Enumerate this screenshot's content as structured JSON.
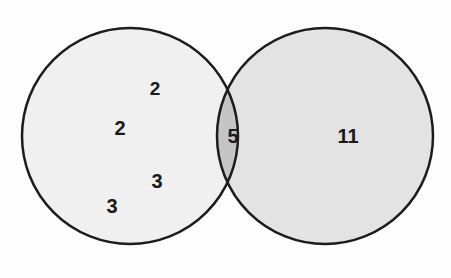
{
  "diagram": {
    "type": "venn-2-set",
    "background_color": "#fdfdfd",
    "stroke_color": "#1c1c1c",
    "stroke_width": 2.5,
    "left_circle": {
      "name": "left-set",
      "cx": 130,
      "cy": 136,
      "r": 108,
      "fill": "#f0f0f0"
    },
    "right_circle": {
      "name": "right-set",
      "cx": 325,
      "cy": 136,
      "r": 108,
      "fill": "#e3e3e3"
    },
    "intersection": {
      "name": "intersection-lens",
      "fill": "#c5c5c5"
    },
    "labels": [
      {
        "text": "2",
        "x": 155,
        "y": 88,
        "region": "left-only",
        "size": "lbl-sm"
      },
      {
        "text": "2",
        "x": 120,
        "y": 128,
        "region": "left-only",
        "size": "lbl-md"
      },
      {
        "text": "3",
        "x": 157,
        "y": 181,
        "region": "left-only",
        "size": "lbl-md"
      },
      {
        "text": "3",
        "x": 112,
        "y": 206,
        "region": "left-only",
        "size": "lbl-md"
      },
      {
        "text": "5",
        "x": 233,
        "y": 136,
        "region": "intersection",
        "size": "lbl-md"
      },
      {
        "text": "11",
        "x": 348,
        "y": 136,
        "region": "right-only",
        "size": "lbl-md"
      }
    ]
  },
  "chart_data": {
    "type": "venn",
    "title": "",
    "sets": [
      "Left set",
      "Right set"
    ],
    "regions": [
      {
        "label": "left-only",
        "values": [
          2,
          2,
          3,
          3
        ]
      },
      {
        "label": "intersection",
        "values": [
          5
        ]
      },
      {
        "label": "right-only",
        "values": [
          11
        ]
      }
    ],
    "left_only_total": 10,
    "intersection_total": 5,
    "right_only_total": 11,
    "legend": "none",
    "grid": false
  }
}
